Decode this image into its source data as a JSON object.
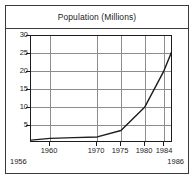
{
  "figure": {
    "background_color": "#ffffff",
    "frame_color": "#3a3a3a"
  },
  "chart_data": {
    "type": "line",
    "title": "Population (Millions)",
    "xlabel": "",
    "ylabel": "",
    "xlim": [
      1956,
      1986
    ],
    "ylim": [
      0,
      30
    ],
    "grid": true,
    "legend": "none",
    "line_color": "#1c1c1c",
    "grid_color": "#8d8d8d",
    "x_ticks": [
      1960,
      1970,
      1975,
      1980,
      1984
    ],
    "x_tick_labels": [
      "1960",
      "1970",
      "1975",
      "1980",
      "1984"
    ],
    "x_range_label_left": "1956",
    "x_range_label_right": "1986",
    "y_ticks": [
      5,
      10,
      15,
      20,
      25,
      30
    ],
    "y_tick_labels": [
      "5",
      "10",
      "15",
      "20",
      "25",
      "30"
    ],
    "series": [
      {
        "name": "Population",
        "x": [
          1956,
          1960,
          1965,
          1970,
          1975,
          1980,
          1984,
          1986
        ],
        "values": [
          0.8,
          1.3,
          1.5,
          1.7,
          3.5,
          10.0,
          20.0,
          26.5
        ]
      }
    ]
  }
}
